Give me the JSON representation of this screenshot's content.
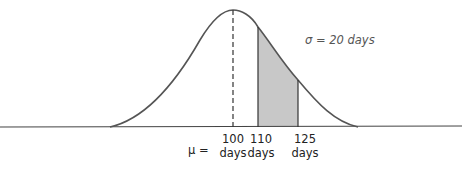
{
  "diagram": {
    "type": "normal-distribution",
    "mean_label": "μ =",
    "sigma_label": "σ = 20 days",
    "ticks": [
      {
        "value": "100",
        "unit": "days"
      },
      {
        "value": "110",
        "unit": "days"
      },
      {
        "value": "125",
        "unit": "days"
      }
    ],
    "shaded_region": {
      "from": 110,
      "to": 125,
      "color": "#c8c8c8"
    },
    "curve_color": "#555555"
  }
}
